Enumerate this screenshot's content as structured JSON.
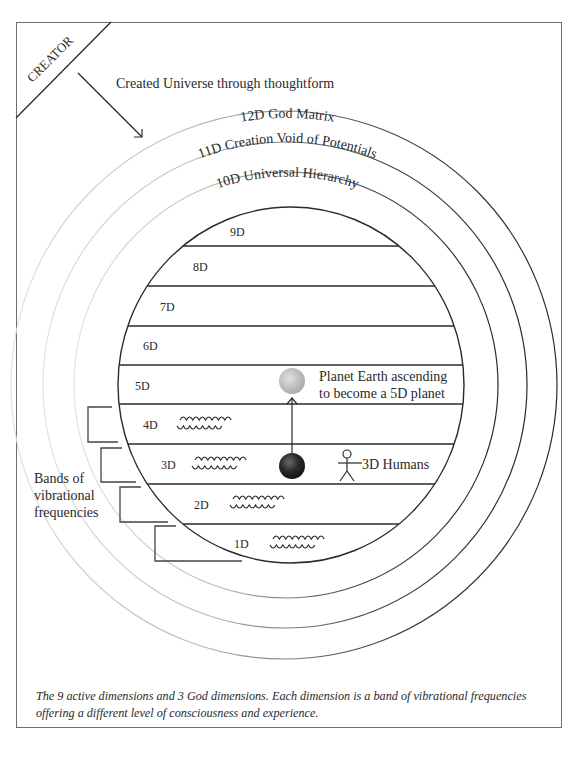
{
  "creator": {
    "label": "CREATOR",
    "arrow_caption": "Created Universe through thoughtform"
  },
  "god_dimensions": [
    {
      "id": "12D",
      "label": "12D God Matrix"
    },
    {
      "id": "11D",
      "label": "11D Creation Void of Potentials"
    },
    {
      "id": "10D",
      "label": "10D Universal Hierarchy"
    }
  ],
  "active_dimensions": [
    {
      "label": "9D",
      "waves": false
    },
    {
      "label": "8D",
      "waves": false
    },
    {
      "label": "7D",
      "waves": false
    },
    {
      "label": "6D",
      "waves": false
    },
    {
      "label": "5D",
      "waves": false
    },
    {
      "label": "4D",
      "waves": true
    },
    {
      "label": "3D",
      "waves": true
    },
    {
      "label": "2D",
      "waves": true
    },
    {
      "label": "1D",
      "waves": true
    }
  ],
  "annotations": {
    "planet_5d_line1": "Planet Earth ascending",
    "planet_5d_line2": "to become a 5D planet",
    "humans_3d": "3D Humans",
    "bands_line1": "Bands of",
    "bands_line2": "vibrational",
    "bands_line3": "frequencies"
  },
  "icons": {
    "planet_5d": "light-grey-planet-icon",
    "planet_3d": "dark-planet-icon",
    "human": "stick-figure-icon",
    "waves": "wave-icon",
    "ascension_arrow": "up-arrow-icon",
    "creator_arrow": "diagonal-arrow-icon"
  },
  "caption": {
    "line1": "The 9 active dimensions and 3 God dimensions. Each dimension is a band of vibrational frequencies",
    "line2": "offering a different level of  consciousness and experience."
  },
  "colors": {
    "line": "#2a2a2a",
    "frame": "#6e6e6e",
    "planet_5d": "#c4c4c4",
    "planet_3d": "#2b2b2b"
  }
}
